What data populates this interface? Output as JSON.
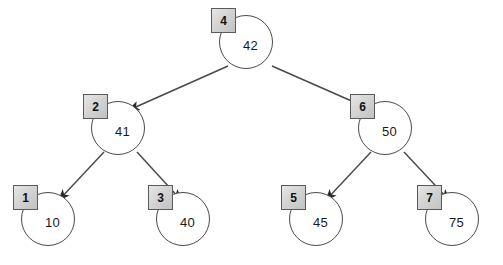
{
  "diagram": {
    "type": "binary-search-tree",
    "background_color": "#ffffff",
    "edge_color": "#4a4a4a",
    "node_fill": "#ffffff",
    "node_border": "#4a4a4a",
    "key_box_fill": "#d4d4d4",
    "key_box_border": "#5a5a5a",
    "nodes": [
      {
        "key": "4",
        "value": "42",
        "cx": 246,
        "cy": 42,
        "level": 0,
        "role": "root"
      },
      {
        "key": "2",
        "value": "41",
        "cx": 118,
        "cy": 128,
        "level": 1,
        "role": "left-child"
      },
      {
        "key": "6",
        "value": "50",
        "cx": 385,
        "cy": 128,
        "level": 1,
        "role": "right-child"
      },
      {
        "key": "1",
        "value": "10",
        "cx": 48,
        "cy": 219,
        "level": 2,
        "role": "leaf"
      },
      {
        "key": "3",
        "value": "40",
        "cx": 183,
        "cy": 219,
        "level": 2,
        "role": "leaf"
      },
      {
        "key": "5",
        "value": "45",
        "cx": 316,
        "cy": 219,
        "level": 2,
        "role": "leaf"
      },
      {
        "key": "7",
        "value": "75",
        "cx": 452,
        "cy": 219,
        "level": 2,
        "role": "leaf"
      }
    ],
    "edges": [
      {
        "from": "4",
        "to": "2",
        "x1": 228,
        "y1": 66,
        "x2": 129,
        "y2": 110
      },
      {
        "from": "4",
        "to": "6",
        "x1": 272,
        "y1": 66,
        "x2": 372,
        "y2": 110
      },
      {
        "from": "2",
        "to": "1",
        "x1": 104,
        "y1": 152,
        "x2": 59,
        "y2": 200
      },
      {
        "from": "2",
        "to": "3",
        "x1": 137,
        "y1": 152,
        "x2": 181,
        "y2": 200
      },
      {
        "from": "6",
        "to": "5",
        "x1": 371,
        "y1": 152,
        "x2": 326,
        "y2": 200
      },
      {
        "from": "6",
        "to": "7",
        "x1": 404,
        "y1": 152,
        "x2": 449,
        "y2": 200
      }
    ]
  }
}
